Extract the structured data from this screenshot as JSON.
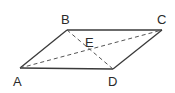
{
  "diagram": {
    "type": "parallelogram-with-diagonals",
    "stroke_color": "#3a3a3a",
    "vertices": {
      "A": {
        "label": "A",
        "x": 20,
        "y": 68
      },
      "B": {
        "label": "B",
        "x": 67,
        "y": 30
      },
      "C": {
        "label": "C",
        "x": 162,
        "y": 30
      },
      "D": {
        "label": "D",
        "x": 113,
        "y": 69
      }
    },
    "intersection": {
      "label": "E"
    },
    "edges_solid": [
      "AB",
      "BC",
      "CD",
      "DA"
    ],
    "edges_dashed": [
      "AC",
      "BD"
    ]
  }
}
